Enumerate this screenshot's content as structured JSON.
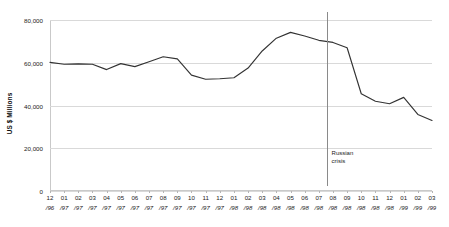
{
  "chart_data": {
    "type": "line",
    "title": "",
    "subtitle": "",
    "xlabel": "",
    "ylabel": "US $ Millions",
    "ylim": [
      0,
      80000
    ],
    "yticks": [
      0,
      20000,
      40000,
      60000,
      80000
    ],
    "ytick_labels": [
      "0",
      "20,000",
      "40,000",
      "60,000",
      "80,000"
    ],
    "grid": true,
    "legend": "none",
    "line_color": "#333333",
    "grid_color": "#d9d9d9",
    "marker_color": "#8a8a8a",
    "categories": [
      "12/96",
      "01/97",
      "02/97",
      "03/97",
      "04/97",
      "05/97",
      "06/97",
      "07/97",
      "08/97",
      "09/97",
      "10/97",
      "11/97",
      "12/97",
      "01/98",
      "02/98",
      "03/98",
      "04/98",
      "05/98",
      "06/98",
      "07/98",
      "08/98",
      "09/98",
      "10/98",
      "11/98",
      "12/98",
      "01/99",
      "02/99",
      "03/99"
    ],
    "xtick_months": [
      "12",
      "01",
      "02",
      "03",
      "04",
      "05",
      "06",
      "07",
      "08",
      "09",
      "10",
      "11",
      "12",
      "01",
      "02",
      "03",
      "04",
      "05",
      "06",
      "07",
      "08",
      "09",
      "10",
      "11",
      "12",
      "01",
      "02",
      "03"
    ],
    "xtick_years": [
      "/96",
      "/97",
      "/97",
      "/97",
      "/97",
      "/97",
      "/97",
      "/97",
      "/97",
      "/97",
      "/97",
      "/97",
      "/97",
      "/98",
      "/98",
      "/98",
      "/98",
      "/98",
      "/98",
      "/98",
      "/98",
      "/98",
      "/98",
      "/98",
      "/98",
      "/99",
      "/99",
      "/99"
    ],
    "values": [
      60200,
      59300,
      59500,
      59300,
      56800,
      59600,
      58200,
      60500,
      62800,
      61800,
      54200,
      52300,
      52500,
      53000,
      57500,
      65500,
      71500,
      74200,
      72500,
      70500,
      69500,
      67000,
      45500,
      42000,
      40800,
      43800,
      35800,
      33000
    ],
    "annotations": [
      {
        "name": "russian-crisis",
        "line1": "Russian",
        "line2": "crisis",
        "at_category_index": 20,
        "offset_categories": -0.45
      }
    ]
  }
}
